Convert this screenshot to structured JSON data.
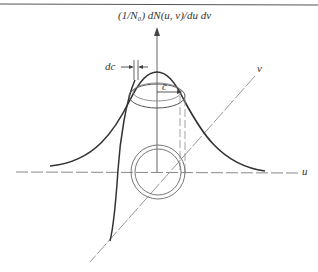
{
  "figure": {
    "vertical_axis_label": "(1/N₀) dN(u, v)/du dv",
    "horizontal_axis_label": "u",
    "depth_axis_label": "v",
    "ring_width_label": "dc",
    "radius_label": "c",
    "colors": {
      "stroke": "#333333",
      "axis": "#777777",
      "background": "#ffffff"
    }
  }
}
